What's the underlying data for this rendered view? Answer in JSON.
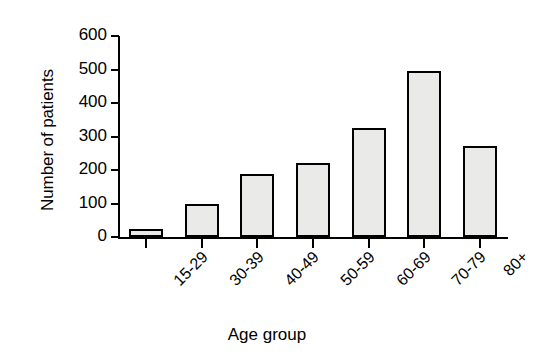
{
  "chart_data": {
    "type": "bar",
    "title": "",
    "xlabel": "Age group",
    "ylabel": "Number of patients",
    "categories": [
      "15-29",
      "30-39",
      "40-49",
      "50-59",
      "60-69",
      "70-79",
      "80+"
    ],
    "values": [
      25,
      98,
      188,
      222,
      325,
      495,
      272
    ],
    "ylim": [
      0,
      600
    ],
    "yticks": [
      0,
      100,
      200,
      300,
      400,
      500,
      600
    ],
    "ytick_labels": [
      "0",
      "100",
      "200",
      "300",
      "400",
      "500",
      "600"
    ],
    "grid": false,
    "legend": null,
    "bar_fill_color": "#eaeae8",
    "bar_edge_color": "#000000",
    "axis_color": "#000000",
    "background_color": "#ffffff"
  }
}
